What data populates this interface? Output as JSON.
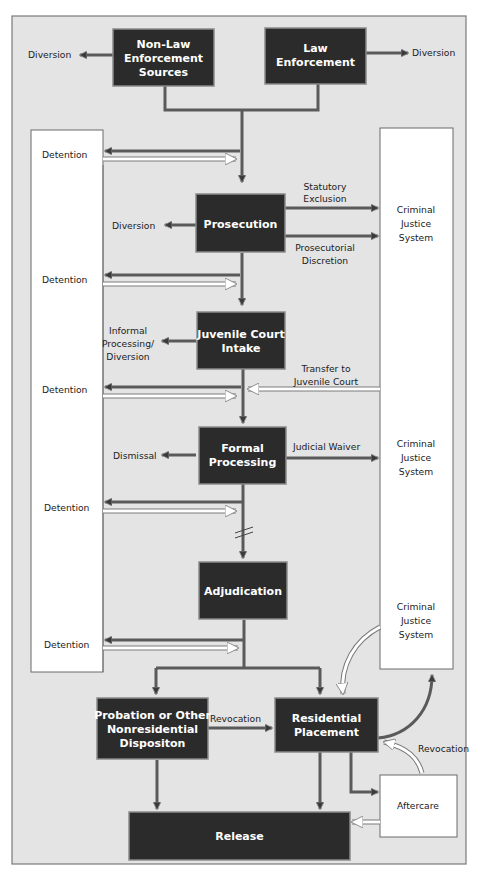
{
  "colors": {
    "background": "#e4e4e4",
    "frame": "#7a7a7a",
    "box_fill": "#2b2b2b",
    "box_text": "#ffffff",
    "panel_fill": "#ffffff",
    "arrow_dark": "#555555",
    "text": "#222222"
  },
  "nodes": {
    "non_law": [
      "Non-Law",
      "Enforcement",
      "Sources"
    ],
    "law": [
      "Law",
      "Enforcement"
    ],
    "prosecution": [
      "Prosecution"
    ],
    "intake": [
      "Juvenile Court",
      "Intake"
    ],
    "formal": [
      "Formal",
      "Processing"
    ],
    "adjudication": [
      "Adjudication"
    ],
    "probation": [
      "Probation or Other",
      "Nonresidential",
      "Dispositon"
    ],
    "residential": [
      "Residential",
      "Placement"
    ],
    "release": [
      "Release"
    ]
  },
  "side_panels": {
    "detention": {
      "labels": [
        "Detention",
        "Detention",
        "Detention",
        "Detention",
        "Detention"
      ]
    },
    "criminal_justice": {
      "label_1": [
        "Criminal",
        "Justice",
        "System"
      ],
      "label_2": [
        "Criminal",
        "Justice",
        "System"
      ],
      "label_3": [
        "Criminal",
        "Justice",
        "System"
      ]
    },
    "aftercare": "Aftercare"
  },
  "edge_labels": {
    "diversion_left": "Diversion",
    "diversion_right": "Diversion",
    "prosecution_diversion": "Diversion",
    "statutory_exclusion": [
      "Statutory",
      "Exclusion"
    ],
    "prosecutorial_discretion": [
      "Prosecutorial",
      "Discretion"
    ],
    "informal": [
      "Informal",
      "Processing/",
      "Diversion"
    ],
    "transfer": [
      "Transfer to",
      "Juvenile Court"
    ],
    "dismissal": "Dismissal",
    "judicial_waiver": "Judicial Waiver",
    "revocation_prob": "Revocation",
    "revocation_aftercare": "Revocation"
  }
}
